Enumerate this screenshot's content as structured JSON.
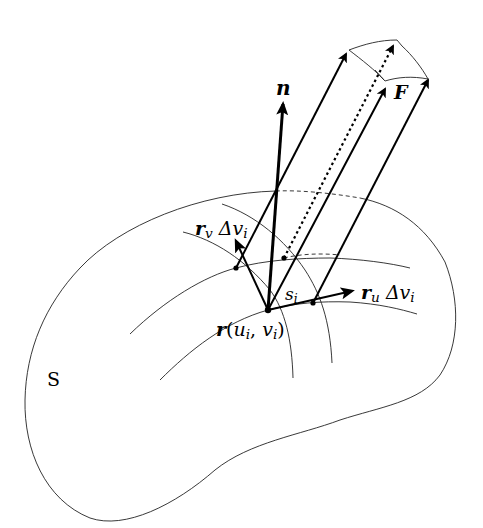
{
  "figure": {
    "type": "surface-integral-diagram",
    "surface_label": "S",
    "patch_label": {
      "base": "s",
      "sub": "i"
    },
    "normal_label": "n",
    "field_label": "F",
    "point_label": {
      "vec": "r",
      "open": "(",
      "u": "u",
      "u_sub": "i",
      "comma": ", ",
      "v": "v",
      "v_sub": "i",
      "close": ")"
    },
    "rv_label": {
      "vec": "r",
      "vec_sub": "v",
      "delta": "Δ",
      "var": "v",
      "var_sub": "i"
    },
    "ru_label": {
      "vec": "r",
      "vec_sub": "u",
      "delta": "Δ",
      "var": "v",
      "var_sub": "i"
    },
    "colors": {
      "stroke": "#000000",
      "background": "#ffffff"
    }
  }
}
